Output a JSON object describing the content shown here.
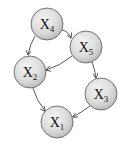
{
  "diagram": {
    "type": "directed-graph",
    "colors": {
      "node_fill_light": "#f2f2f2",
      "node_fill_dark": "#bdbdbd",
      "node_stroke": "#555555",
      "edge": "#444444",
      "text": "#111111"
    },
    "nodes": [
      {
        "id": "X4",
        "letter": "X",
        "sub": "4",
        "cx": 47,
        "cy": 24,
        "r": 16
      },
      {
        "id": "X5",
        "letter": "X",
        "sub": "5",
        "cx": 86,
        "cy": 47,
        "r": 16
      },
      {
        "id": "X2",
        "letter": "X",
        "sub": "2",
        "cx": 30,
        "cy": 72,
        "r": 16
      },
      {
        "id": "X3",
        "letter": "X",
        "sub": "3",
        "cx": 101,
        "cy": 94,
        "r": 16
      },
      {
        "id": "X1",
        "letter": "X",
        "sub": "1",
        "cx": 57,
        "cy": 122,
        "r": 16
      }
    ],
    "edges": [
      {
        "from": "X4",
        "to": "X5"
      },
      {
        "from": "X4",
        "to": "X2"
      },
      {
        "from": "X5",
        "to": "X2"
      },
      {
        "from": "X5",
        "to": "X3"
      },
      {
        "from": "X2",
        "to": "X1"
      },
      {
        "from": "X3",
        "to": "X1"
      }
    ]
  }
}
